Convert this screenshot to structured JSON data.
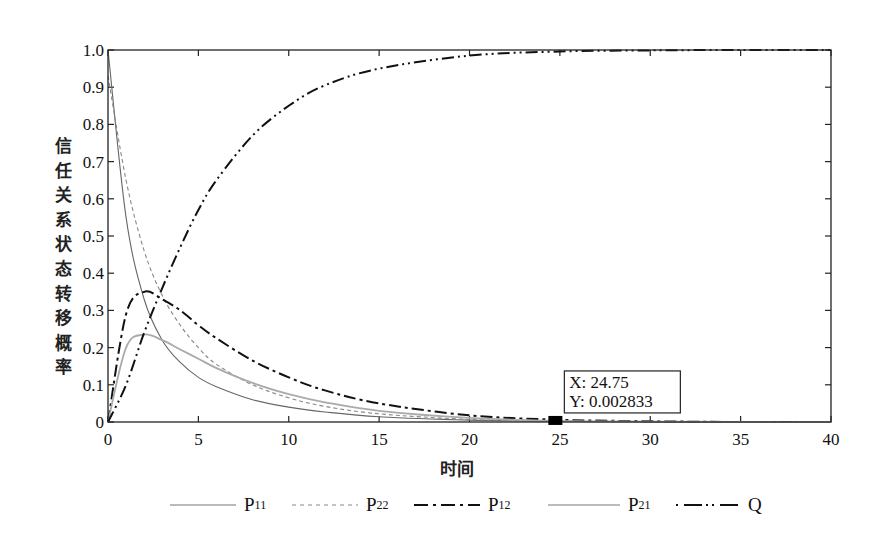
{
  "chart_data": {
    "type": "line",
    "title": "",
    "xlabel": "时间",
    "ylabel": "信任关系状态转移概率",
    "xlim": [
      0,
      40
    ],
    "ylim": [
      0,
      1.0
    ],
    "xticks": [
      0,
      5,
      10,
      15,
      20,
      25,
      30,
      35,
      40
    ],
    "yticks": [
      "0",
      "0.1",
      "0.2",
      "0.3",
      "0.4",
      "0.5",
      "0.6",
      "0.7",
      "0.8",
      "0.9",
      "1.0"
    ],
    "grid": false,
    "legend_position": "bottom",
    "x": [
      0,
      1,
      2,
      3,
      4,
      5,
      6,
      8,
      10,
      12,
      15,
      20,
      25,
      30,
      35,
      40
    ],
    "series": [
      {
        "name": "P11",
        "style": "solid-thin-gray",
        "values": [
          1.0,
          0.55,
          0.33,
          0.22,
          0.16,
          0.12,
          0.095,
          0.06,
          0.04,
          0.027,
          0.014,
          0.005,
          0.002,
          0.001,
          0.0,
          0.0
        ]
      },
      {
        "name": "P22",
        "style": "dashed-gray",
        "values": [
          0.93,
          0.65,
          0.46,
          0.34,
          0.26,
          0.2,
          0.155,
          0.1,
          0.065,
          0.042,
          0.022,
          0.007,
          0.002,
          0.001,
          0.0,
          0.0
        ]
      },
      {
        "name": "P12",
        "style": "dash-dot-black",
        "values": [
          0.0,
          0.29,
          0.35,
          0.33,
          0.3,
          0.26,
          0.225,
          0.165,
          0.12,
          0.085,
          0.05,
          0.018,
          0.006,
          0.002,
          0.0,
          0.0
        ]
      },
      {
        "name": "P21",
        "style": "solid-light-gray",
        "values": [
          0.0,
          0.2,
          0.235,
          0.22,
          0.195,
          0.17,
          0.145,
          0.105,
          0.075,
          0.053,
          0.03,
          0.011,
          0.003,
          0.001,
          0.0,
          0.0
        ]
      },
      {
        "name": "Q",
        "style": "dash-dot-dot-black",
        "values": [
          0.0,
          0.1,
          0.24,
          0.36,
          0.47,
          0.57,
          0.65,
          0.77,
          0.85,
          0.905,
          0.95,
          0.985,
          0.996,
          0.999,
          1.0,
          1.0
        ]
      }
    ],
    "annotations": [
      {
        "type": "datatip",
        "x": 24.75,
        "y": 0.002833,
        "text_x": "X: 24.75",
        "text_y": "Y: 0.002833"
      }
    ]
  },
  "legend": {
    "items": [
      {
        "base": "P",
        "sub": "11"
      },
      {
        "base": "P",
        "sub": "22"
      },
      {
        "base": "P",
        "sub": "12"
      },
      {
        "base": "P",
        "sub": "21"
      },
      {
        "base": "Q",
        "sub": ""
      }
    ]
  }
}
